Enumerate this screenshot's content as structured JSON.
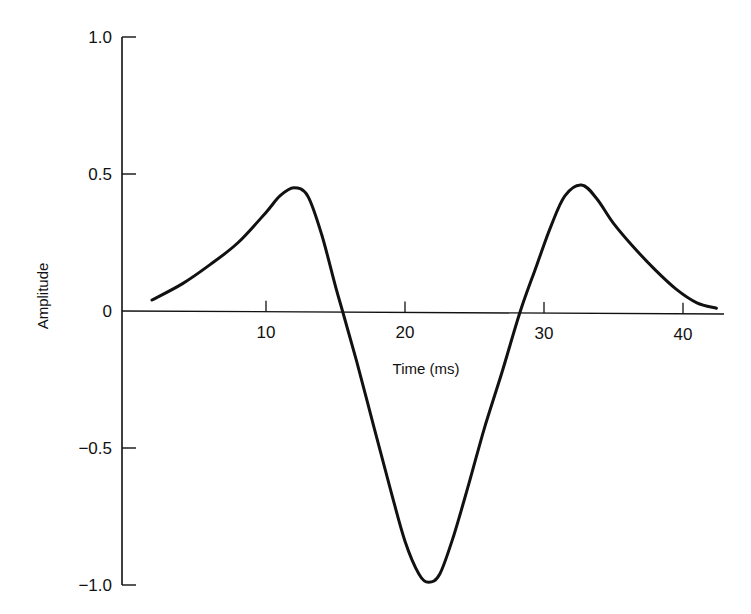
{
  "chart_data": {
    "type": "line",
    "title": "",
    "xlabel": "Time (ms)",
    "ylabel": "Amplitude",
    "xlim": [
      0,
      43
    ],
    "ylim": [
      -1.0,
      1.0
    ],
    "x_ticks": [
      10,
      20,
      30,
      40
    ],
    "x_tick_labels": [
      "10",
      "20",
      "30",
      "40"
    ],
    "y_ticks": [
      1.0,
      0.5,
      0,
      -0.5,
      -1.0
    ],
    "y_tick_labels": [
      "1.0",
      "0.5",
      "0",
      "−0.5",
      "−1.0"
    ],
    "grid": false,
    "legend": null,
    "series": [
      {
        "name": "waveform",
        "color": "#111111",
        "x": [
          1.8,
          4,
          6,
          8,
          10,
          11,
          12,
          13,
          14,
          15,
          15.5,
          16.5,
          17.8,
          19,
          20,
          21,
          21.7,
          22.5,
          23.5,
          24.6,
          25.7,
          27,
          28.3,
          29.5,
          30.5,
          31.5,
          32.7,
          33.8,
          35,
          36.5,
          38,
          39.5,
          41,
          42.4
        ],
        "y": [
          0.04,
          0.1,
          0.17,
          0.25,
          0.36,
          0.42,
          0.45,
          0.42,
          0.28,
          0.09,
          0.0,
          -0.18,
          -0.43,
          -0.66,
          -0.84,
          -0.96,
          -0.99,
          -0.96,
          -0.82,
          -0.63,
          -0.43,
          -0.22,
          0.0,
          0.17,
          0.31,
          0.42,
          0.46,
          0.41,
          0.32,
          0.23,
          0.15,
          0.08,
          0.03,
          0.01
        ]
      }
    ]
  },
  "axes": {
    "x_title": "Time (ms)",
    "y_title": "Amplitude"
  }
}
